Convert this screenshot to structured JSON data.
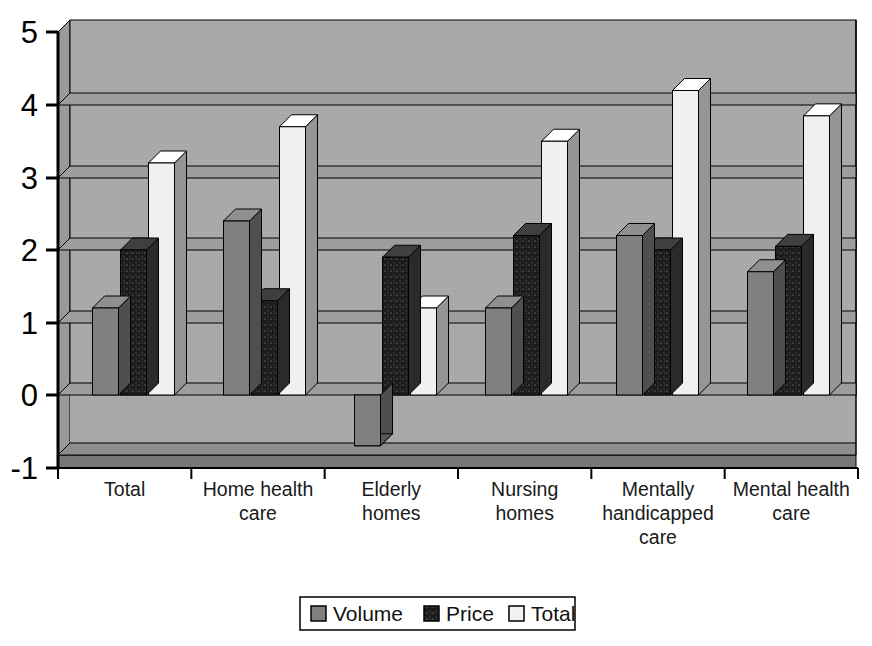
{
  "chart_data": {
    "type": "bar",
    "title": "",
    "subtitle": "",
    "xlabel": "",
    "ylabel": "",
    "categories": [
      "Total",
      "Home health care",
      "Elderly homes",
      "Nursing homes",
      "Mentally handicapped care",
      "Mental health care"
    ],
    "series": [
      {
        "name": "Volume",
        "color": "#808080",
        "values": [
          1.2,
          2.4,
          -0.7,
          1.2,
          2.2,
          1.7
        ]
      },
      {
        "name": "Price",
        "color": "#1a1a1a",
        "values": [
          2.0,
          1.3,
          1.9,
          2.2,
          2.0,
          2.05
        ]
      },
      {
        "name": "Total",
        "color": "#f0f0f0",
        "values": [
          3.2,
          3.7,
          1.2,
          3.5,
          4.2,
          3.85
        ]
      }
    ],
    "ylim": [
      -1,
      5
    ],
    "y_ticks": [
      "-1",
      "0",
      "1",
      "2",
      "3",
      "4",
      "5"
    ],
    "y_tick_values": [
      -1,
      0,
      1,
      2,
      3,
      4,
      5
    ],
    "grid": true,
    "gridlines_at": [
      0,
      1,
      2,
      3,
      4
    ],
    "legend": {
      "position": "bottom",
      "entries": [
        {
          "label": "Volume",
          "swatch": "#808080"
        },
        {
          "label": "Price",
          "swatch": "#1a1a1a"
        },
        {
          "label": "Total",
          "swatch": "#f0f0f0"
        }
      ]
    },
    "style": {
      "plot_background": "#a9a9a9",
      "floor_color": "#a0a0a0",
      "axis_color": "#000000",
      "bar_3d": true
    }
  },
  "category_label_lines": [
    [
      "Total"
    ],
    [
      "Home health",
      "care"
    ],
    [
      "Elderly",
      "homes"
    ],
    [
      "Nursing",
      "homes"
    ],
    [
      "Mentally",
      "handicapped",
      "care"
    ],
    [
      "Mental health",
      "care"
    ]
  ],
  "axis": {
    "y_tick_0": "5",
    "y_tick_1": "4",
    "y_tick_2": "3",
    "y_tick_3": "2",
    "y_tick_4": "1",
    "y_tick_5": "0",
    "y_tick_6": "-1"
  },
  "legend_items": {
    "item_0_label": "Volume",
    "item_1_label": "Price",
    "item_2_label": "Total"
  }
}
